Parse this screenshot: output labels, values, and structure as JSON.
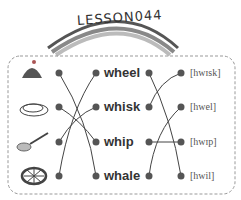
{
  "title": "LESSON044",
  "words": [
    {
      "label": "wheel"
    },
    {
      "label": "whisk"
    },
    {
      "label": "whip"
    },
    {
      "label": "whale"
    }
  ],
  "phonetics": [
    {
      "label": "[hwɪsk]"
    },
    {
      "label": "[hwel]"
    },
    {
      "label": "[hwɪp]"
    },
    {
      "label": "[hwil]"
    }
  ],
  "pictures": [
    "whale-icon",
    "whip-icon",
    "whisk-icon",
    "wheel-icon"
  ],
  "left_connections": [
    [
      0,
      3
    ],
    [
      1,
      2
    ],
    [
      2,
      1
    ],
    [
      3,
      0
    ]
  ],
  "right_connections": [
    [
      0,
      3
    ],
    [
      1,
      0
    ],
    [
      2,
      2
    ],
    [
      3,
      1
    ]
  ],
  "colors": {
    "line": "#444",
    "dot": "#555",
    "border": "#999"
  }
}
